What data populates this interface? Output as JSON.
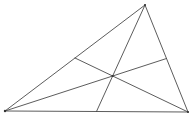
{
  "diagram": {
    "type": "triangle-medians",
    "stroke_color": "#4a4a4a",
    "vertex_color": "#333333",
    "background": "#ffffff",
    "vertices": {
      "A": {
        "x": 5,
        "y": 111
      },
      "B": {
        "x": 188,
        "y": 112
      },
      "C": {
        "x": 145,
        "y": 5
      }
    },
    "midpoints": {
      "AB": {
        "x": 96.5,
        "y": 111.5
      },
      "BC": {
        "x": 166.5,
        "y": 58.5
      },
      "CA": {
        "x": 75,
        "y": 58
      }
    },
    "centroid": {
      "x": 112.7,
      "y": 76
    },
    "edges": [
      {
        "from": "A",
        "to": "B"
      },
      {
        "from": "B",
        "to": "C"
      },
      {
        "from": "C",
        "to": "A"
      }
    ],
    "medians": [
      {
        "from": "A",
        "to": "BC"
      },
      {
        "from": "B",
        "to": "CA"
      },
      {
        "from": "C",
        "to": "AB"
      }
    ]
  }
}
